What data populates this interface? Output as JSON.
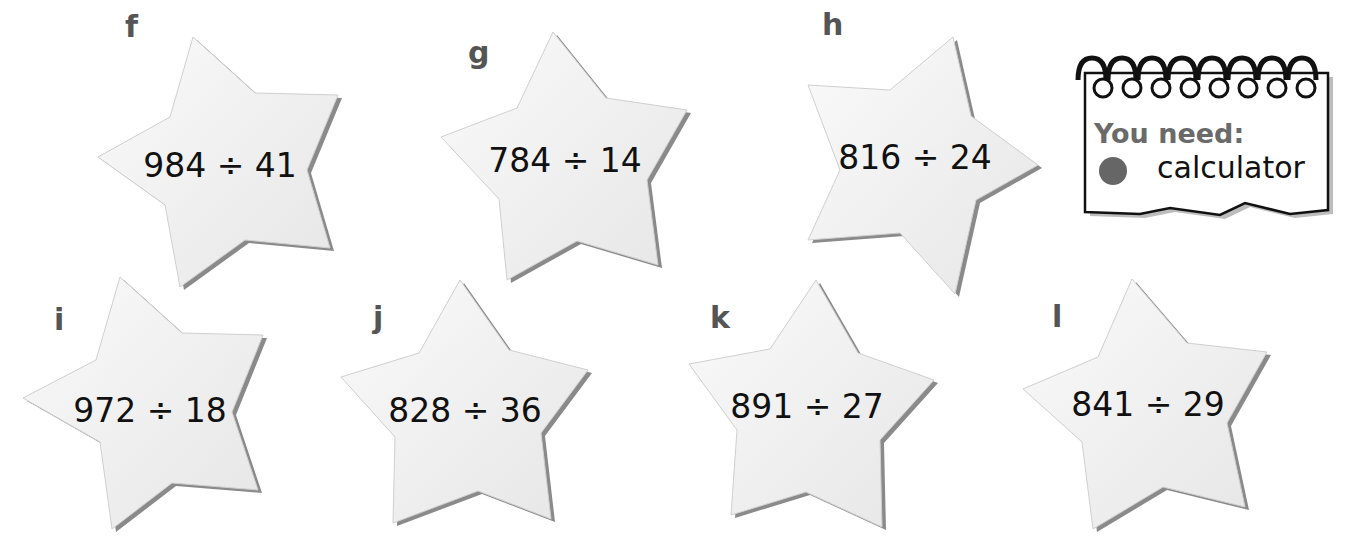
{
  "problems": [
    {
      "label": "f",
      "expression": "984 ÷ 41"
    },
    {
      "label": "g",
      "expression": "784 ÷ 14"
    },
    {
      "label": "h",
      "expression": "816 ÷ 24"
    },
    {
      "label": "i",
      "expression": "972 ÷ 18"
    },
    {
      "label": "j",
      "expression": "828 ÷ 36"
    },
    {
      "label": "k",
      "expression": "891 ÷ 27"
    },
    {
      "label": "l",
      "expression": "841 ÷ 29"
    }
  ],
  "you_need": {
    "title": "You need:",
    "items": [
      {
        "bullet_color": "#666666",
        "text": "calculator"
      }
    ]
  },
  "colors": {
    "star_fill": "#f2f2f2",
    "star_edge": "#cfcfcf",
    "star_shadow": "#8a8a8a",
    "label": "#555555",
    "text": "#111111"
  }
}
